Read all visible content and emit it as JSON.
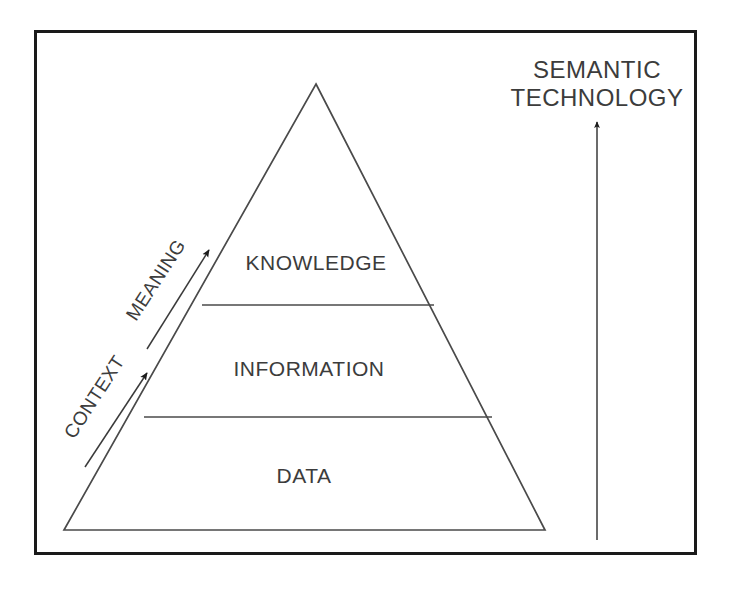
{
  "diagram": {
    "type": "pyramid",
    "frame": {
      "name": "outer-frame",
      "border_color": "#1a1a1a"
    },
    "colors": {
      "background": "#ffffff",
      "stroke": "#4a4a4a",
      "frame_stroke": "#1a1a1a",
      "text": "#3c3c3c",
      "arrow_fill": "#1c1c1c"
    },
    "pyramid": {
      "name": "dikw-pyramid",
      "tiers": [
        {
          "id": "knowledge",
          "label": "KNOWLEDGE",
          "level": 3,
          "position": "top"
        },
        {
          "id": "information",
          "label": "INFORMATION",
          "level": 2,
          "position": "middle"
        },
        {
          "id": "data",
          "label": "DATA",
          "level": 1,
          "position": "bottom"
        }
      ]
    },
    "flow_arrows": [
      {
        "id": "context",
        "label": "CONTEXT",
        "from_tier": "data",
        "to_tier": "information",
        "direction": "up"
      },
      {
        "id": "meaning",
        "label": "MEANING",
        "from_tier": "information",
        "to_tier": "knowledge",
        "direction": "up"
      }
    ],
    "technology_arrow": {
      "id": "semantic-technology",
      "label_line_1": "SEMANTIC",
      "label_line_2": "TECHNOLOGY",
      "direction": "up"
    }
  }
}
